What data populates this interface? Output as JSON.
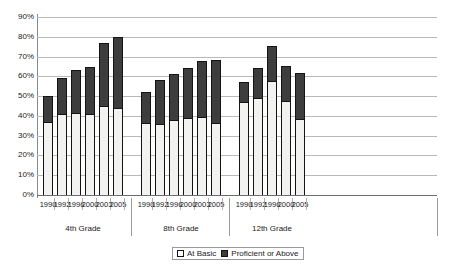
{
  "chart_data": {
    "type": "bar",
    "title": "",
    "subtitle": "",
    "xlabel": "",
    "ylabel": "",
    "stacked": true,
    "grid": true,
    "legend_position": "bottom",
    "ylim": [
      0,
      90
    ],
    "ytick_labels": [
      "90%",
      "80%",
      "70%",
      "60%",
      "50%",
      "40%",
      "30%",
      "20%",
      "10%",
      "0%"
    ],
    "ytick_values": [
      90,
      80,
      70,
      60,
      50,
      40,
      30,
      20,
      10,
      0
    ],
    "categories": [
      "1990",
      "1992",
      "1996",
      "2000",
      "2003",
      "2005",
      "1990",
      "1992",
      "1996",
      "2000",
      "2003",
      "2005",
      "1990",
      "1992",
      "1996",
      "2000",
      "2005"
    ],
    "groups": [
      {
        "label": "4th Grade",
        "years": [
          "1990",
          "1992",
          "1996",
          "2000",
          "2003",
          "2005"
        ]
      },
      {
        "label": "8th Grade",
        "years": [
          "1990",
          "1992",
          "1996",
          "2000",
          "2003",
          "2005"
        ]
      },
      {
        "label": "12th Grade",
        "years": [
          "1990",
          "1992",
          "1996",
          "2000",
          "2005"
        ]
      }
    ],
    "series": [
      {
        "name": "At Basic",
        "color": "#f2f2f0",
        "values": [
          37,
          41,
          41.5,
          41,
          45,
          44,
          36.5,
          36,
          38,
          39,
          39.5,
          36.5,
          47,
          49,
          57.5,
          47.5,
          38.5
        ]
      },
      {
        "name": "Proficient or Above",
        "color": "#3d3d3d",
        "values": [
          13,
          18,
          21.5,
          23.5,
          32,
          36,
          15.5,
          22,
          23,
          25,
          28.5,
          32,
          10,
          15,
          18,
          17.5,
          23
        ]
      }
    ],
    "totals": [
      50,
      59,
      63,
      64.5,
      77,
      80,
      52,
      58,
      61,
      64,
      68,
      68.5,
      57,
      64,
      75.5,
      65,
      61.5
    ]
  },
  "legend": {
    "items": [
      {
        "label": "At Basic",
        "swatch": "light-square-swatch"
      },
      {
        "label": "Proficient or Above",
        "swatch": "dark-square-swatch"
      }
    ]
  }
}
